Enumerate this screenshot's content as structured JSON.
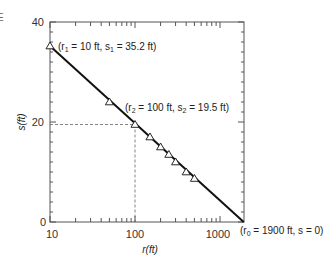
{
  "page": {
    "edge_fragment": "E"
  },
  "chart_data": {
    "type": "line",
    "title": "",
    "xlabel": "r(ft)",
    "ylabel": "s(ft)",
    "xscale": "log",
    "xlim": [
      10,
      1914
    ],
    "ylim": [
      0,
      40
    ],
    "x_ticks": [
      10,
      100,
      1000
    ],
    "x_tick_labels": [
      "10",
      "100",
      "1000"
    ],
    "y_ticks": [
      0,
      20,
      40
    ],
    "y_tick_labels": [
      "0",
      "20",
      "40"
    ],
    "grid": false,
    "legend": null,
    "series": [
      {
        "name": "measured drawdown",
        "marker": "triangle-open",
        "x": [
          10,
          50,
          100,
          150,
          200,
          250,
          300,
          400,
          500
        ],
        "y": [
          35.2,
          24.0,
          19.5,
          17.0,
          15.0,
          13.5,
          12.0,
          10.0,
          8.7
        ]
      },
      {
        "name": "fitted line",
        "style": "solid",
        "x": [
          10,
          1900
        ],
        "y": [
          35.2,
          0
        ]
      }
    ],
    "guides": [
      {
        "type": "dashed",
        "x": 100,
        "y": 19.5
      }
    ],
    "annotations": [
      {
        "id": "r1",
        "text_parts": [
          "(r",
          "1",
          " = 10 ft, s",
          "1",
          " = 35.2 ft)"
        ],
        "x": 10,
        "y": 35.2
      },
      {
        "id": "r2",
        "text_parts": [
          "(r",
          "2",
          " = 100 ft, s",
          "2",
          " = 19.5 ft)"
        ],
        "x": 100,
        "y": 19.5
      },
      {
        "id": "r0",
        "text_parts": [
          "(r",
          "0",
          " = 1900 ft, s = 0)"
        ],
        "x": 1900,
        "y": 0
      }
    ],
    "colors": {
      "line": "#111111",
      "frame": "#555555",
      "dash": "#666666",
      "text": "#222222"
    }
  }
}
